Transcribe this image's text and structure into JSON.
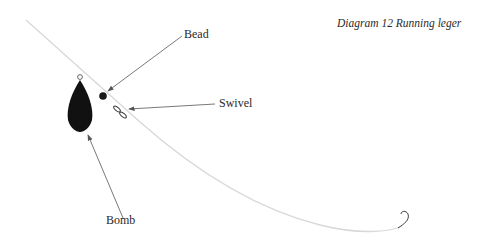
{
  "caption": "Diagram 12 Running leger",
  "labels": {
    "bead": "Bead",
    "swivel": "Swivel",
    "bomb": "Bomb"
  },
  "colors": {
    "line": "#d8d8d8",
    "arrow": "#555555",
    "weight": "#111111",
    "text": "#2a2a2a"
  }
}
